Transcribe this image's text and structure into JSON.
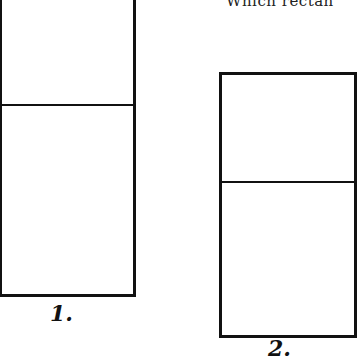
{
  "question": {
    "text": "Which rectan"
  },
  "rectangles": [
    {
      "label": "1.",
      "top_part": "upper",
      "bottom_part": "lower"
    },
    {
      "label": "2.",
      "top_part": "upper",
      "bottom_part": "lower"
    }
  ]
}
